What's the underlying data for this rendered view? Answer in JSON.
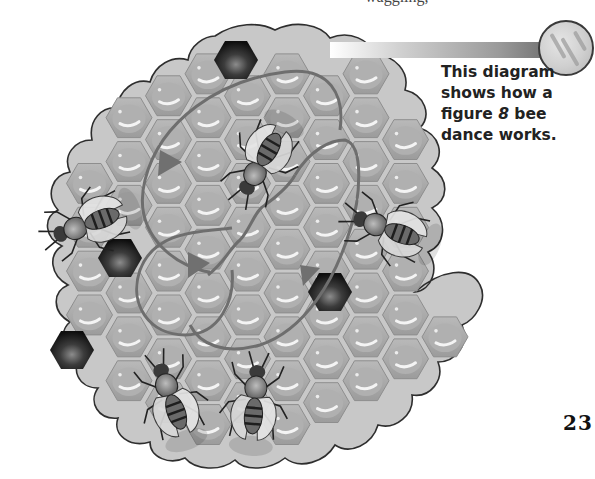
{
  "page": {
    "top_text_fragment": "waggling,",
    "page_number": "23"
  },
  "caption": {
    "line1": "This diagram",
    "line2": "shows how a",
    "line3_pre": "figure ",
    "line3_em": "8",
    "line3_post": " bee",
    "line4": "dance works."
  },
  "diagram": {
    "colors": {
      "comb_fill": "#c4c4c4",
      "cell_fill": "#a8a8a8",
      "dark_cell": "#2a2a2a",
      "dance_path": "#6e6e6e",
      "outline": "#333333"
    },
    "icons": [
      "honeycomb",
      "bee",
      "dance-path-arrow",
      "badge-circle"
    ],
    "bee_count": 5,
    "dark_cell_count": 4,
    "arrow_count": 4
  }
}
